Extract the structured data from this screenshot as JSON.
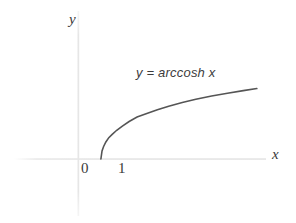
{
  "figure": {
    "background_color": "#ffffff",
    "width": 296,
    "height": 223
  },
  "axes": {
    "y_label": "y",
    "x_label": "x",
    "axis_color": "#e6e6e6",
    "label_color": "#3a3a3a"
  },
  "ticks": {
    "origin_label": "0",
    "one_label": "1"
  },
  "annotation": {
    "text": "y = arccosh x",
    "color": "#3c3c3c"
  },
  "curve": {
    "color": "#555555",
    "width": 1.6
  },
  "chart_data": {
    "type": "line",
    "title": "",
    "subtitle": "",
    "xlabel": "x",
    "ylabel": "y",
    "grid": false,
    "legend_position": "inline-annotation",
    "annotations": [
      "y = arccosh x"
    ],
    "xticks": [
      0,
      1
    ],
    "xticklabels": [
      "0",
      "1"
    ],
    "yticks": [],
    "yticklabels": [],
    "xlim": [
      -2.2,
      8.3
    ],
    "ylim": [
      -1.8,
      3.6
    ],
    "series": [
      {
        "name": "y = arccosh x",
        "color": "#555555",
        "x": [
          1.0,
          1.05,
          1.12,
          1.22,
          1.35,
          1.5,
          1.7,
          1.95,
          2.25,
          2.6,
          3.0,
          3.5,
          4.0,
          4.6,
          5.2,
          5.9,
          6.6,
          7.3,
          7.9
        ],
        "y": [
          0.0,
          0.316,
          0.49,
          0.665,
          0.834,
          0.9624,
          1.1232,
          1.2859,
          1.4636,
          1.6374,
          1.7627,
          1.9248,
          2.0634,
          2.2082,
          2.3309,
          2.4584,
          2.5705,
          2.6716,
          2.7533
        ],
        "equation": "y = arccosh x",
        "domain_start": 1.0
      }
    ]
  }
}
